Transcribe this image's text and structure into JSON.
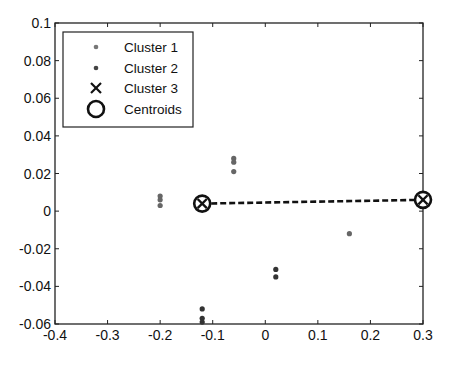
{
  "chart_data": {
    "type": "scatter",
    "title": "",
    "xlabel": "",
    "ylabel": "",
    "xlim": [
      -0.4,
      0.3
    ],
    "ylim": [
      -0.06,
      0.1
    ],
    "grid": false,
    "legend_position": "upper-left",
    "x_ticks": [
      "-0.4",
      "-0.3",
      "-0.2",
      "-0.1",
      "0",
      "0.1",
      "0.2",
      "0.3"
    ],
    "y_ticks": [
      "0.1",
      "0.08",
      "0.06",
      "0.04",
      "0.02",
      "0",
      "-0.02",
      "-0.04",
      "-0.06"
    ],
    "legend": [
      "Cluster 1",
      "Cluster 2",
      "Cluster 3",
      "Centroids"
    ],
    "series": [
      {
        "name": "Cluster 1",
        "marker": "dot",
        "color": "#666666",
        "points": [
          [
            -0.2,
            0.008
          ],
          [
            -0.2,
            0.006
          ],
          [
            -0.2,
            0.003
          ],
          [
            -0.06,
            0.028
          ],
          [
            -0.06,
            0.026
          ],
          [
            -0.06,
            0.021
          ],
          [
            0.16,
            -0.012
          ]
        ]
      },
      {
        "name": "Cluster 2",
        "marker": "dot",
        "color": "#333333",
        "points": [
          [
            -0.12,
            -0.052
          ],
          [
            -0.12,
            -0.057
          ],
          [
            -0.12,
            -0.059
          ],
          [
            0.02,
            -0.031
          ],
          [
            0.02,
            -0.035
          ]
        ]
      },
      {
        "name": "Cluster 3",
        "marker": "x",
        "color": "#111111",
        "points": []
      },
      {
        "name": "Centroids",
        "marker": "circle-x",
        "color": "#111111",
        "points": [
          [
            -0.12,
            0.004
          ],
          [
            0.3,
            0.006
          ]
        ]
      }
    ],
    "annotations": [
      {
        "type": "dashed-line",
        "from": [
          -0.12,
          0.004
        ],
        "to": [
          0.3,
          0.006
        ],
        "color": "#111111"
      }
    ]
  }
}
